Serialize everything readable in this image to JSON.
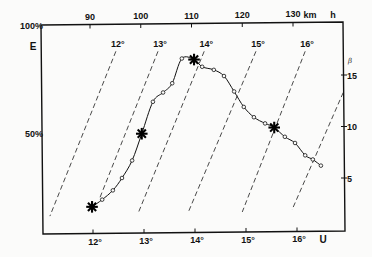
{
  "chart_data": {
    "type": "line",
    "title": "",
    "grid": false,
    "legend": null,
    "axes": {
      "top": {
        "label": "h",
        "unit": "km",
        "ticks": [
          90,
          100,
          110,
          120,
          130
        ],
        "tick_labels": [
          "90",
          "100",
          "110",
          "120",
          "130"
        ]
      },
      "bottom": {
        "label": "U",
        "ticks": [
          12,
          13,
          14,
          15,
          16
        ],
        "tick_labels": [
          "12°",
          "13°",
          "14°",
          "15°",
          "16°"
        ]
      },
      "left": {
        "label": "E",
        "ticks": [
          100,
          50
        ],
        "tick_labels": [
          "100%",
          "50%"
        ]
      },
      "right": {
        "label": "β",
        "ticks": [
          15,
          10,
          5
        ],
        "tick_labels": [
          "15",
          "10",
          "5"
        ]
      }
    },
    "series": [
      {
        "name": "β vs h",
        "x_axis": "h (km)",
        "y_axis": "β",
        "marker": "open-circle",
        "highlight_marker": "asterisk",
        "highlighted_indices": [
          0,
          5,
          10,
          18
        ],
        "x": [
          90.4,
          92.4,
          94.5,
          96.3,
          98.3,
          100.2,
          102.4,
          104.4,
          106.2,
          108.1,
          110.5,
          112.1,
          114.4,
          116.4,
          118.4,
          120.3,
          122.3,
          124.5,
          126.3,
          128.4,
          130.4,
          132.4,
          133.9,
          135.5
        ],
        "y": [
          2.2,
          2.9,
          3.8,
          5.0,
          6.7,
          9.3,
          12.4,
          13.3,
          14.2,
          16.6,
          16.5,
          15.8,
          15.5,
          14.9,
          13.4,
          11.9,
          10.9,
          10.3,
          9.9,
          9.0,
          8.4,
          7.2,
          6.8,
          6.2
        ]
      }
    ],
    "isolines": [
      {
        "label": "12°",
        "h": [
          95.1,
          82.1
        ],
        "beta": [
          17.3,
          1.3
        ]
      },
      {
        "label": "13°",
        "h": [
          103.4,
          91.8
        ],
        "beta": [
          17.3,
          2.9
        ]
      },
      {
        "label": "14°",
        "h": [
          112.5,
          99.5
        ],
        "beta": [
          17.3,
          1.6
        ]
      },
      {
        "label": "15°",
        "h": [
          122.7,
          109.3
        ],
        "beta": [
          17.3,
          1.6
        ]
      },
      {
        "label": "16°",
        "h": [
          132.4,
          120.0
        ],
        "beta": [
          17.3,
          1.7
        ]
      },
      {
        "label": "",
        "h": [
          139.9,
          129.8
        ],
        "beta": [
          13.3,
          1.9
        ]
      }
    ]
  }
}
